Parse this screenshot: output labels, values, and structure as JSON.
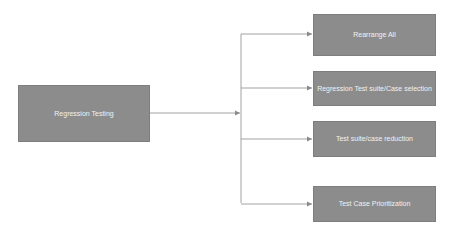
{
  "diagram": {
    "source": {
      "label": "Regression Testing",
      "x": 18,
      "y": 85,
      "w": 132,
      "h": 57
    },
    "targets": [
      {
        "label": "Rearrange All",
        "x": 313,
        "y": 14,
        "w": 123,
        "h": 42
      },
      {
        "label": "Regression Test suite/Case selection",
        "x": 313,
        "y": 71,
        "w": 123,
        "h": 35
      },
      {
        "label": "Test suite/case reduction",
        "x": 313,
        "y": 121,
        "w": 123,
        "h": 36
      },
      {
        "label": "Test Case Prioritization",
        "x": 313,
        "y": 186,
        "w": 123,
        "h": 36
      }
    ],
    "colors": {
      "box_fill": "#8c8c8c",
      "box_text": "#f2f2f2",
      "line": "#8a8a8a"
    }
  }
}
